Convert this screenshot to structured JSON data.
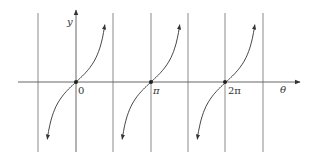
{
  "chart_data": {
    "type": "line",
    "title": "",
    "function": "y = tan(theta)",
    "xlabel": "θ",
    "ylabel": "y",
    "x_tick_labels": [
      "0",
      "π",
      "2π"
    ],
    "x_ticks": [
      0,
      3.14159,
      6.28319
    ],
    "asymptotes": [
      -1.5708,
      1.5708,
      4.7124,
      7.854
    ],
    "zeros": [
      0,
      3.14159,
      6.28319
    ],
    "branches": [
      {
        "center": 0,
        "from": -1.5708,
        "to": 1.5708
      },
      {
        "center": 3.14159,
        "from": 1.5708,
        "to": 4.7124
      },
      {
        "center": 6.28319,
        "from": 4.7124,
        "to": 7.854
      }
    ],
    "grid": false
  },
  "labels": {
    "y_axis": "y",
    "x_axis": "θ",
    "tick_0": "0",
    "tick_pi": "π",
    "tick_2pi": "2π"
  },
  "colors": {
    "axis": "#555555",
    "curve": "#333333",
    "asymptote": "#888888"
  }
}
